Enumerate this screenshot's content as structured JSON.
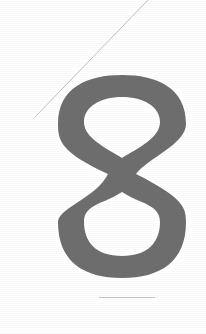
{
  "page": {
    "width": 206,
    "height": 334,
    "background_color": "#ffffff"
  },
  "figure": {
    "glyph_character": "8",
    "glyph_name": "numeral-eight",
    "glyph_style": "didone-crossed-stroke",
    "glyph_color": "#6e6e6e",
    "glyph_bounds": {
      "x": 58,
      "y": 75,
      "width": 128,
      "height": 203
    },
    "upper_bowl": {
      "name": "upper-bowl",
      "center_x": 122,
      "center_y": 124,
      "radius_x": 64,
      "radius_y": 49
    },
    "lower_bowl": {
      "name": "lower-bowl",
      "center_x": 122,
      "center_y": 222,
      "radius_x": 64,
      "radius_y": 56
    },
    "waist": {
      "name": "stroke-crossing",
      "center_x": 122,
      "center_y": 174
    }
  },
  "rules": {
    "diagonal": {
      "name": "diagonal-hairline",
      "color": "#b9b9b9",
      "x1": 148,
      "y1": 0,
      "x2": 35,
      "y2": 117,
      "stroke_width": 0.9
    },
    "horizontal": {
      "name": "horizontal-hairline",
      "color": "#c9c9c9",
      "x1": 99,
      "y1": 297.5,
      "x2": 155,
      "y2": 297.5,
      "stroke_width": 1.1
    }
  },
  "accessibility": {
    "alt_text": "Large gray numeral 8 with a faint diagonal hairline above left and a short horizontal rule below"
  }
}
